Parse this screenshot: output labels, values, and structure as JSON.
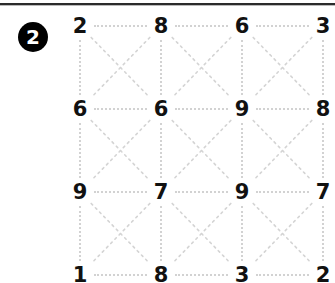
{
  "badge": {
    "label": "2"
  },
  "puzzle": {
    "type": "number-grid",
    "rows": 4,
    "columns": 4,
    "grid": [
      [
        "2",
        "8",
        "6",
        "3"
      ],
      [
        "6",
        "6",
        "9",
        "8"
      ],
      [
        "9",
        "7",
        "9",
        "7"
      ],
      [
        "1",
        "8",
        "3",
        "2"
      ]
    ],
    "connector_style": "dotted",
    "connector_color": "#d2d2d2",
    "connectors": [
      "horizontal",
      "vertical",
      "diagonal-x"
    ],
    "digit_color": "#111111"
  },
  "decor": {
    "top_rule_color": "#2b2b2b"
  }
}
